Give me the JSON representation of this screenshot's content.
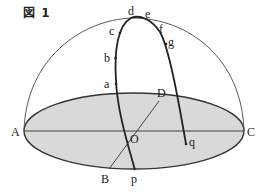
{
  "figure": {
    "title": "図 1",
    "colors": {
      "plane_fill": "#d9d9d9",
      "stroke": "#333333",
      "background": "#ffffff"
    },
    "points": {
      "A": "A",
      "B": "B",
      "C": "C",
      "D": "D",
      "O": "O",
      "a": "a",
      "b": "b",
      "c": "c",
      "d": "d",
      "e": "e",
      "f": "f",
      "g": "g",
      "p": "p",
      "q": "q"
    }
  }
}
